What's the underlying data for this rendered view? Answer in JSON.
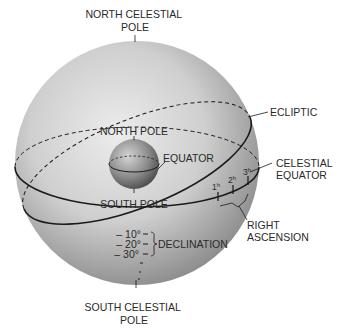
{
  "labels": {
    "north_celestial_pole": [
      "NORTH CELESTIAL",
      "POLE"
    ],
    "south_celestial_pole": [
      "SOUTH CELESTIAL",
      "POLE"
    ],
    "ecliptic": "ECLIPTIC",
    "celestial_equator": [
      "CELESTIAL",
      "EQUATOR"
    ],
    "right_ascension": [
      "RIGHT",
      "ASCENSION"
    ],
    "north_pole": "NORTH POLE",
    "south_pole": "SOUTH POLE",
    "equator": "EQUATOR",
    "declination": "DECLINATION"
  },
  "declination_marks": [
    "– 10°",
    "– 20°",
    "– 30°"
  ],
  "hour_marks": [
    {
      "label": "1",
      "sup": "h"
    },
    {
      "label": "2",
      "sup": "h"
    },
    {
      "label": "3",
      "sup": "h"
    }
  ],
  "colors": {
    "sphere_light": "#e6e6e6",
    "sphere_dark": "#8f8f8f",
    "earth_light": "#c8c8c8",
    "earth_dark": "#555555",
    "line": "#1a1a1a"
  }
}
